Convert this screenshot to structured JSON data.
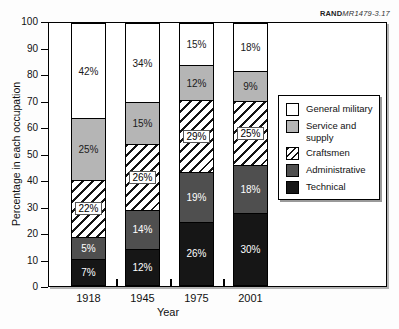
{
  "source_label": {
    "brand": "RAND",
    "doc": "MR1479-3.17"
  },
  "chart_data": {
    "type": "bar",
    "stacked": true,
    "categories": [
      "1918",
      "1945",
      "1975",
      "2001"
    ],
    "series": [
      {
        "name": "Technical",
        "values": [
          7,
          12,
          26,
          30
        ],
        "color": "#161616",
        "text_color": "#ffffff",
        "pattern": "solid"
      },
      {
        "name": "Administrative",
        "values": [
          5,
          14,
          19,
          18
        ],
        "color": "#4f4f4f",
        "text_color": "#ffffff",
        "pattern": "solid"
      },
      {
        "name": "Craftsmen",
        "values": [
          22,
          26,
          29,
          25
        ],
        "color": "#ffffff",
        "text_color": "#000000",
        "pattern": "hatch",
        "label_chip": true
      },
      {
        "name": "Service and supply",
        "values": [
          25,
          15,
          12,
          9
        ],
        "color": "#b5b5b5",
        "text_color": "#1a1a1a",
        "pattern": "solid"
      },
      {
        "name": "General military",
        "values": [
          42,
          34,
          15,
          18
        ],
        "color": "#ffffff",
        "text_color": "#1a1a1a",
        "pattern": "solid"
      }
    ],
    "xlabel": "Year",
    "ylabel": "Percentage in each occupation",
    "ylim": [
      0,
      100
    ],
    "y_ticks": [
      0,
      10,
      20,
      30,
      40,
      50,
      60,
      70,
      80,
      90,
      100
    ],
    "grid": false,
    "data_labels": "percent",
    "legend": {
      "position": "right-inside",
      "items_top_to_bottom": [
        "General military",
        "Service and supply",
        "Craftsmen",
        "Administrative",
        "Technical"
      ]
    }
  }
}
